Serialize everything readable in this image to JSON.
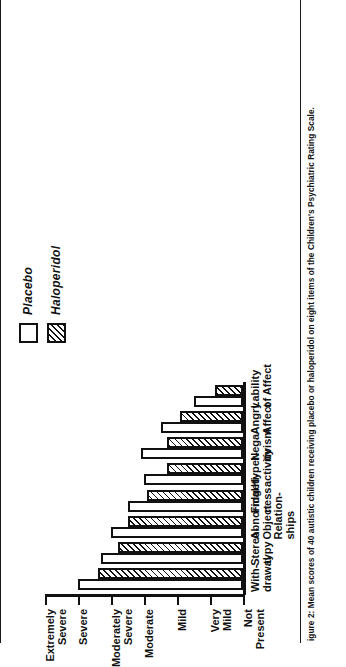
{
  "figure": {
    "caption": "igure 2:  Mean scores of 40 autistic children receiving placebo or haloperidol on eight items of the Children's Psychiatric Rating Scale."
  },
  "legend": {
    "items": [
      {
        "label": "Placebo",
        "swatch": "open-square-swatch"
      },
      {
        "label": "Haloperidol",
        "swatch": "hatched-square-swatch"
      }
    ]
  },
  "chart_data": {
    "type": "bar",
    "title": "",
    "xlabel": "",
    "ylabel": "",
    "orientation": "vertical-bars-rotated-90",
    "grid": false,
    "legend_position": "top-right",
    "ylim": [
      0,
      6
    ],
    "ytick_values": [
      0,
      1,
      2,
      3,
      4,
      5,
      6
    ],
    "ytick_labels": [
      "Not\nPresent",
      "Very\nMild",
      "Mild",
      "Moderate",
      "Moderately\nSevere",
      "Severe",
      "Extremely\nSevere"
    ],
    "categories": [
      "With-\ndrawal",
      "Stereo-\ntypy",
      "Abnormal\nObject\nRelation-\nships",
      "Fidgeti-\nness",
      "Hyper-\nactivity",
      "Nega-\ntivism",
      "Angry\nAffect",
      "Lability\nof Affect"
    ],
    "series": [
      {
        "name": "Placebo",
        "style": "open",
        "values": [
          5.0,
          4.3,
          4.0,
          3.5,
          3.0,
          3.1,
          2.5,
          1.5
        ]
      },
      {
        "name": "Haloperidol",
        "style": "hatched",
        "values": [
          4.4,
          3.8,
          3.5,
          2.9,
          2.3,
          2.3,
          1.9,
          0.85
        ]
      }
    ]
  },
  "colors": {
    "ink": "#111111",
    "paper": "#ffffff"
  }
}
